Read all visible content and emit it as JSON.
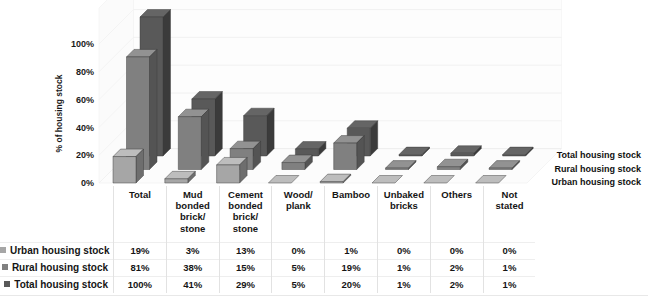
{
  "chart_data": {
    "type": "bar",
    "subtype": "3d-clustered-bar",
    "title": "",
    "xlabel": "",
    "ylabel": "% of housing stock",
    "ylim": [
      0,
      100
    ],
    "ytick_labels": [
      "0%",
      "20%",
      "40%",
      "60%",
      "80%",
      "100%"
    ],
    "ytick_values": [
      0,
      20,
      40,
      60,
      80,
      100
    ],
    "grid": true,
    "legend_position": "right-depth-axis",
    "categories": [
      "Total",
      "Mud bonded brick/ stone",
      "Cement bonded brick/ stone",
      "Wood/ plank",
      "Bamboo",
      "Unbaked bricks",
      "Others",
      "Not stated"
    ],
    "series": [
      {
        "name": "Total housing stock",
        "color": "#595959",
        "values": [
          100,
          41,
          29,
          5,
          20,
          1,
          2,
          1
        ]
      },
      {
        "name": "Rural housing stock",
        "color": "#808080",
        "values": [
          81,
          38,
          15,
          5,
          19,
          1,
          2,
          1
        ]
      },
      {
        "name": "Urban housing stock",
        "color": "#a6a6a6",
        "values": [
          19,
          3,
          13,
          0,
          1,
          0,
          0,
          0
        ]
      }
    ]
  },
  "axis": {
    "y_title": "% of housing stock",
    "ticks": [
      "100%",
      "80%",
      "60%",
      "40%",
      "20%",
      "0%"
    ]
  },
  "depth_legend": [
    {
      "label": "Total housing stock"
    },
    {
      "label": "Rural housing stock"
    },
    {
      "label": "Urban housing stock"
    }
  ],
  "table": {
    "column_headers": [
      [
        "Total"
      ],
      [
        "Mud",
        "bonded",
        "brick/",
        "stone"
      ],
      [
        "Cement",
        "bonded",
        "brick/",
        "stone"
      ],
      [
        "Wood/",
        "plank"
      ],
      [
        "Bamboo"
      ],
      [
        "Unbaked",
        "bricks"
      ],
      [
        "Others"
      ],
      [
        "Not",
        "stated"
      ]
    ],
    "rows": [
      {
        "label": "Urban housing stock",
        "swatch": "#a6a6a6",
        "values": [
          "19%",
          "3%",
          "13%",
          "0%",
          "1%",
          "0%",
          "0%",
          "0%"
        ]
      },
      {
        "label": "Rural housing stock",
        "swatch": "#808080",
        "values": [
          "81%",
          "38%",
          "15%",
          "5%",
          "19%",
          "1%",
          "2%",
          "1%"
        ]
      },
      {
        "label": "Total housing stock",
        "swatch": "#595959",
        "values": [
          "100%",
          "41%",
          "29%",
          "5%",
          "20%",
          "1%",
          "2%",
          "1%"
        ]
      }
    ]
  }
}
